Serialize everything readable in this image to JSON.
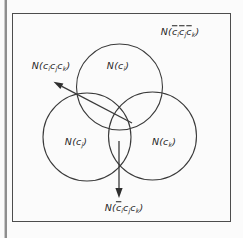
{
  "figure": {
    "type": "venn-diagram",
    "colors": {
      "line": "#3a3a3a",
      "text": "#1f1f1f",
      "background": "#fbfbfb",
      "box_border": "#4d4d4d",
      "page_rule": "#8e8e8e"
    },
    "labels": {
      "outside_region": {
        "parts": [
          {
            "t": "N("
          },
          {
            "t": "c",
            "bar": true,
            "sub": "i"
          },
          {
            "t": "c",
            "bar": true,
            "sub": "j"
          },
          {
            "t": "c",
            "bar": true,
            "sub": "k"
          },
          {
            "t": ")"
          }
        ]
      },
      "triple_intersection": {
        "parts": [
          {
            "t": "N("
          },
          {
            "t": "c",
            "sub": "i"
          },
          {
            "t": "c",
            "sub": "j"
          },
          {
            "t": "c",
            "sub": "k"
          },
          {
            "t": ")"
          }
        ]
      },
      "set_i": {
        "parts": [
          {
            "t": "N("
          },
          {
            "t": "c",
            "sub": "i"
          },
          {
            "t": ")"
          }
        ]
      },
      "set_j": {
        "parts": [
          {
            "t": "N("
          },
          {
            "t": "c",
            "sub": "j"
          },
          {
            "t": ")"
          }
        ]
      },
      "set_k": {
        "parts": [
          {
            "t": "N("
          },
          {
            "t": "c",
            "sub": "k"
          },
          {
            "t": ")"
          }
        ]
      },
      "jk_without_i": {
        "parts": [
          {
            "t": "N("
          },
          {
            "t": "c",
            "bar": true,
            "sub": "i"
          },
          {
            "t": "c",
            "sub": "j"
          },
          {
            "t": "c",
            "sub": "k"
          },
          {
            "t": ")"
          }
        ]
      }
    }
  }
}
